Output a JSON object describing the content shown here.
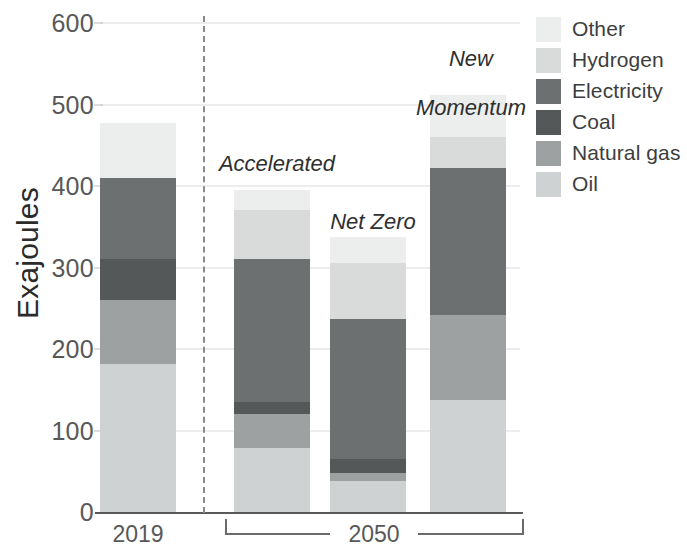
{
  "chart_data": {
    "type": "bar",
    "stacked": true,
    "title": "",
    "xlabel": "",
    "ylabel": "Exajoules",
    "ylim": [
      0,
      600
    ],
    "yticks": [
      0,
      100,
      200,
      300,
      400,
      500,
      600
    ],
    "ytick_labels": [
      "0",
      "100",
      "200",
      "300",
      "400",
      "500",
      "600"
    ],
    "grid": true,
    "legend_position": "right",
    "categories": [
      "2019",
      "Accelerated",
      "Net Zero",
      "New Momentum"
    ],
    "group_labels": [
      "2019",
      "2050"
    ],
    "scenario_labels": [
      "Accelerated",
      "Net Zero",
      "New\nMomentum"
    ],
    "series": [
      {
        "name": "Oil",
        "color": "#cfd2d2",
        "values": [
          182,
          78,
          38,
          137
        ]
      },
      {
        "name": "Natural gas",
        "color": "#9ea1a1",
        "values": [
          78,
          42,
          10,
          105
        ]
      },
      {
        "name": "Coal",
        "color": "#555858",
        "values": [
          50,
          15,
          17,
          0
        ]
      },
      {
        "name": "Electricity",
        "color": "#6d7070",
        "values": [
          100,
          175,
          172,
          180
        ]
      },
      {
        "name": "Hydrogen",
        "color": "#d9dbdb",
        "values": [
          0,
          60,
          68,
          38
        ]
      },
      {
        "name": "Other",
        "color": "#eceeee",
        "values": [
          67,
          25,
          32,
          52
        ]
      }
    ],
    "totals": [
      477,
      395,
      337,
      512
    ]
  },
  "axis": {
    "y_title": "Exajoules",
    "ticks": [
      {
        "label": "600",
        "value": 600
      },
      {
        "label": "500",
        "value": 500
      },
      {
        "label": "400",
        "value": 400
      },
      {
        "label": "300",
        "value": 300
      },
      {
        "label": "200",
        "value": 200
      },
      {
        "label": "100",
        "value": 100
      },
      {
        "label": "0",
        "value": 0
      }
    ],
    "x_labels": [
      {
        "label": "2019"
      },
      {
        "label": "2050"
      }
    ]
  },
  "annotations": {
    "accelerated": "Accelerated",
    "net_zero": "Net Zero",
    "new_momentum_line1": "New",
    "new_momentum_line2": "Momentum"
  },
  "legend": {
    "items": [
      {
        "label": "Other",
        "color": "#eceeee"
      },
      {
        "label": "Hydrogen",
        "color": "#d9dbdb"
      },
      {
        "label": "Electricity",
        "color": "#6d7070"
      },
      {
        "label": "Coal",
        "color": "#555858"
      },
      {
        "label": "Natural gas",
        "color": "#9ea1a1"
      },
      {
        "label": "Oil",
        "color": "#cfd2d2"
      }
    ]
  }
}
